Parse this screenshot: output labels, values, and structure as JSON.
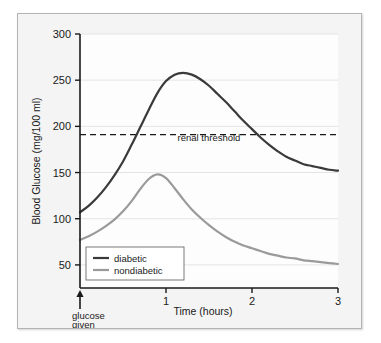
{
  "chart_data": {
    "type": "line",
    "title": "",
    "xlabel": "Time (hours)",
    "ylabel": "Blood Glucose (mg/100 ml)",
    "xlim": [
      0,
      3
    ],
    "ylim": [
      25,
      300
    ],
    "xticks": [
      "1",
      "2",
      "3"
    ],
    "xtick_values": [
      1,
      2,
      3
    ],
    "yticks": [
      "50",
      "100",
      "150",
      "200",
      "250",
      "300"
    ],
    "ytick_values": [
      50,
      100,
      150,
      200,
      250,
      300
    ],
    "grid": true,
    "legend_position": "lower-left",
    "x": [
      0.0,
      0.1,
      0.2,
      0.3,
      0.4,
      0.5,
      0.6,
      0.7,
      0.8,
      0.9,
      1.0,
      1.1,
      1.2,
      1.3,
      1.4,
      1.5,
      1.6,
      1.7,
      1.8,
      1.9,
      2.0,
      2.1,
      2.2,
      2.3,
      2.4,
      2.5,
      2.6,
      2.7,
      2.8,
      2.9,
      3.0
    ],
    "series": [
      {
        "name": "diabetic",
        "color": "#3a3a3a",
        "values": [
          107,
          114,
          123,
          134,
          147,
          162,
          180,
          199,
          218,
          236,
          249,
          256,
          258,
          256,
          251,
          244,
          235,
          226,
          216,
          206,
          197,
          188,
          180,
          173,
          167,
          163,
          159,
          157,
          155,
          153,
          152
        ]
      },
      {
        "name": "nondiabetic",
        "color": "#9a9a9a",
        "values": [
          77,
          81,
          86,
          92,
          99,
          108,
          119,
          132,
          143,
          148,
          144,
          133,
          121,
          110,
          101,
          93,
          86,
          80,
          75,
          71,
          68,
          65,
          62,
          60,
          58,
          57,
          55,
          54,
          53,
          52,
          51
        ]
      }
    ],
    "annotations": [
      {
        "name": "renal-threshold",
        "label": "renal threshold",
        "type": "hline",
        "value": 191,
        "style": "dashed",
        "color": "#1a1a1a"
      },
      {
        "name": "glucose-given",
        "label_line1": "glucose",
        "label_line2": "given",
        "type": "arrow",
        "x": 0,
        "color": "#1a1a1a"
      }
    ]
  },
  "legend": {
    "items": [
      {
        "label": "diabetic",
        "color": "#3a3a3a"
      },
      {
        "label": "nondiabetic",
        "color": "#9a9a9a"
      }
    ]
  },
  "axes": {
    "y_title": "Blood Glucose (mg/100 ml)",
    "x_title": "Time (hours)",
    "y_tick_labels": [
      "300",
      "250",
      "200",
      "150",
      "100",
      "50"
    ],
    "x_tick_labels": [
      "1",
      "2",
      "3"
    ]
  },
  "annotations": {
    "renal_threshold_label": "renal threshold",
    "glucose_given_line1": "glucose",
    "glucose_given_line2": "given"
  },
  "colors": {
    "diabetic": "#3a3a3a",
    "nondiabetic": "#9a9a9a",
    "axis": "#1a1a1a",
    "grid": "#e4e4e4",
    "panel_bg": "#f4f4f4",
    "plot_bg": "#fdfdfd",
    "panel_border": "#b4b4b4"
  }
}
